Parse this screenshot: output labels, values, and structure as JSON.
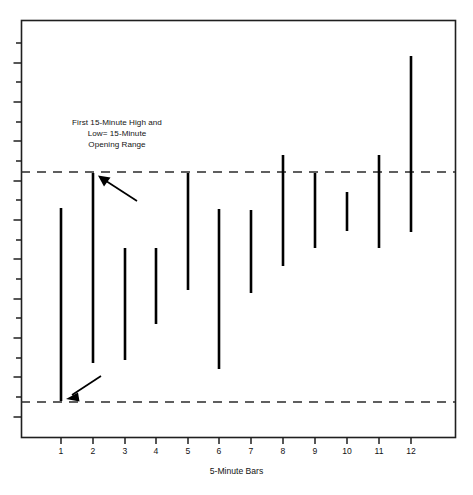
{
  "chart_data": {
    "type": "bar",
    "subtype": "ohlc-range-bars",
    "title": "",
    "xlabel": "5-Minute Bars",
    "ylabel": "",
    "grid": false,
    "legend": null,
    "categories": [
      "1",
      "2",
      "3",
      "4",
      "5",
      "6",
      "7",
      "8",
      "9",
      "10",
      "11",
      "12"
    ],
    "series": [
      {
        "name": "5-Minute Bar Range",
        "type": "high-low-bar",
        "values_px": [
          {
            "category": "1",
            "x": 61,
            "high_y": 208,
            "low_y": 401
          },
          {
            "category": "2",
            "x": 93,
            "high_y": 173,
            "low_y": 363
          },
          {
            "category": "3",
            "x": 125,
            "high_y": 248,
            "low_y": 360
          },
          {
            "category": "4",
            "x": 156,
            "high_y": 248,
            "low_y": 324
          },
          {
            "category": "5",
            "x": 188,
            "high_y": 173,
            "low_y": 290
          },
          {
            "category": "6",
            "x": 219,
            "high_y": 209,
            "low_y": 369
          },
          {
            "category": "7",
            "x": 251,
            "high_y": 210,
            "low_y": 293
          },
          {
            "category": "8",
            "x": 283,
            "high_y": 155,
            "low_y": 266
          },
          {
            "category": "9",
            "x": 315,
            "high_y": 173,
            "low_y": 248
          },
          {
            "category": "10",
            "x": 347,
            "high_y": 192,
            "low_y": 231
          },
          {
            "category": "11",
            "x": 379,
            "high_y": 155,
            "low_y": 248
          },
          {
            "category": "12",
            "x": 411,
            "high_y": 56,
            "low_y": 232
          }
        ]
      }
    ],
    "reference_lines": [
      {
        "name": "15-minute opening range high",
        "y_px": 172,
        "style": "dashed"
      },
      {
        "name": "15-minute opening range low",
        "y_px": 402,
        "style": "dashed"
      }
    ],
    "annotations": [
      {
        "name": "opening-range-note",
        "text": "First 15-Minute High and\nLow= 15-Minute\nOpening Range",
        "x_px": 117,
        "y_px": 134
      }
    ],
    "arrows": [
      {
        "name": "arrow-to-opening-range-high",
        "from": [
          137,
          200
        ],
        "to": [
          99,
          176
        ]
      },
      {
        "name": "arrow-to-opening-range-low",
        "from": [
          100,
          376
        ],
        "to": [
          66,
          398
        ]
      }
    ],
    "plot_frame_px": {
      "left": 21,
      "top": 20,
      "right": 455,
      "bottom": 437
    },
    "colors": {
      "bar": "#000000",
      "frame": "#1f1f1f",
      "dashed_line": "#2b2b2b",
      "text": "#141414",
      "background": "#ffffff"
    }
  },
  "annotation": {
    "line1": "First 15-Minute High and",
    "line2": "Low= 15-Minute",
    "line3": "Opening Range",
    "full": "First 15-Minute High and\nLow= 15-Minute\nOpening Range"
  },
  "axis": {
    "x_title": "5-Minute Bars",
    "x_ticks": [
      "1",
      "2",
      "3",
      "4",
      "5",
      "6",
      "7",
      "8",
      "9",
      "10",
      "11",
      "12"
    ]
  }
}
